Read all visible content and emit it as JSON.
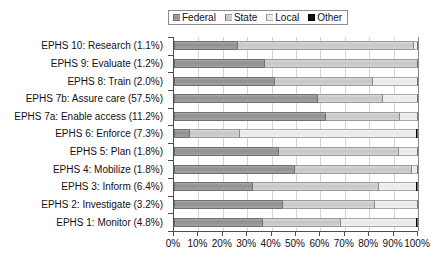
{
  "chart_data": {
    "type": "bar",
    "subtype": "horizontal-stacked-100",
    "title": "",
    "xlabel": "",
    "ylabel": "",
    "xlim": [
      0,
      100
    ],
    "xticks": [
      "0%",
      "10%",
      "20%",
      "30%",
      "40%",
      "50%",
      "60%",
      "70%",
      "80%",
      "90%",
      "100%"
    ],
    "xtick_values": [
      0,
      10,
      20,
      30,
      40,
      50,
      60,
      70,
      80,
      90,
      100
    ],
    "grid": "vertical",
    "legend_position": "top-center",
    "legend": [
      "Federal",
      "State",
      "Local",
      "Other"
    ],
    "categories": [
      "EPHS 10: Research (1.1%)",
      "EPHS 9: Evaluate (1.2%)",
      "EPHS 8: Train (2.0%)",
      "EPHS 7b: Assure care (57.5%)",
      "EPHS 7a: Enable access (11.2%)",
      "EPHS 6: Enforce (7.3%)",
      "EPHS 5: Plan (1.8%)",
      "EPHS 4: Mobilize (1.8%)",
      "EPHS 3: Inform (6.4%)",
      "EPHS 2: Investigate (3.2%)",
      "EPHS 1: Monitor (4.8%)"
    ],
    "series": [
      {
        "name": "Federal",
        "color": "#969696",
        "values": [
          25.8,
          37.0,
          41.0,
          58.6,
          61.9,
          6.1,
          42.6,
          49.2,
          32.0,
          44.3,
          36.1
        ]
      },
      {
        "name": "State",
        "color": "#cccccc",
        "values": [
          72.2,
          63.0,
          40.0,
          26.6,
          30.5,
          20.5,
          49.4,
          48.0,
          51.5,
          37.7,
          31.9
        ]
      },
      {
        "name": "Local",
        "color": "#eeeeee",
        "values": [
          2.0,
          0.0,
          19.0,
          14.8,
          7.6,
          72.4,
          8.0,
          2.8,
          15.7,
          18.0,
          31.0
        ]
      },
      {
        "name": "Other",
        "color": "#111111",
        "values": [
          0.0,
          0.0,
          0.0,
          0.0,
          0.0,
          1.0,
          0.0,
          0.0,
          0.8,
          0.0,
          1.0
        ]
      }
    ]
  },
  "legend_block": {
    "items": [
      {
        "label": "Federal",
        "swatch_class": "seg-federal"
      },
      {
        "label": "State",
        "swatch_class": "seg-state"
      },
      {
        "label": "Local",
        "swatch_class": "seg-local"
      },
      {
        "label": "Other",
        "swatch_class": "seg-other"
      }
    ]
  }
}
